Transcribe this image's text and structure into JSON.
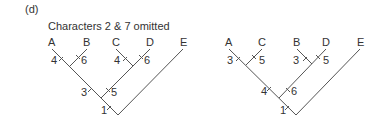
{
  "panel_label": "(d)",
  "subtitle": "Characters 2 & 7 omitted",
  "trees": [
    {
      "leaves": [
        "A",
        "B",
        "C",
        "D",
        "E"
      ],
      "branch_labels": {
        "A": "4",
        "B": "6",
        "C": "4",
        "D": "6",
        "AB": "3",
        "CD": "5",
        "ABCD": "1"
      }
    },
    {
      "leaves": [
        "A",
        "C",
        "B",
        "D",
        "E"
      ],
      "branch_labels": {
        "A": "3",
        "C": "5",
        "B": "3",
        "D": "5",
        "AC": "4",
        "BD": "6",
        "ABCD": "1"
      }
    }
  ]
}
